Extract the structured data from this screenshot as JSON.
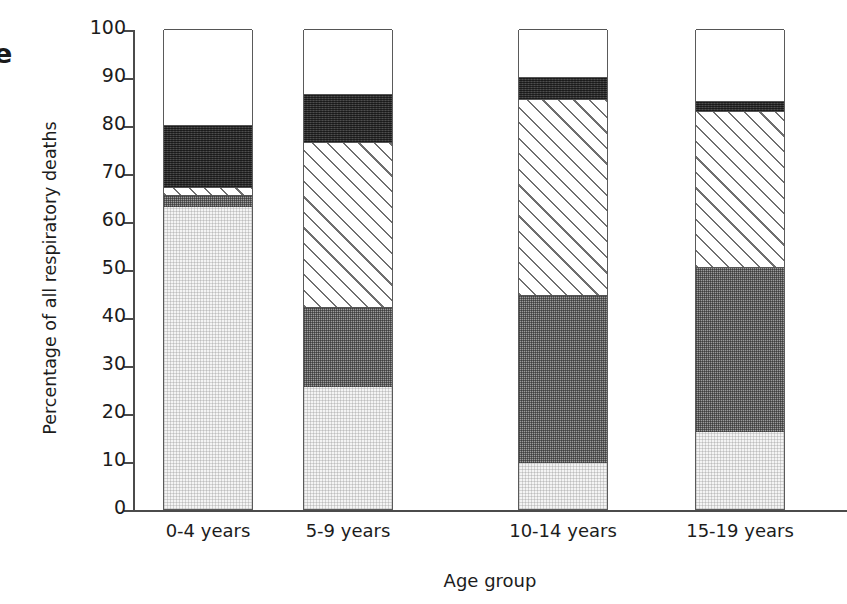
{
  "figure_letter": "e",
  "chart_data": {
    "type": "bar",
    "subtype": "stacked-bar",
    "title": "",
    "xlabel": "Age group",
    "ylabel": "Percentage of all respiratory deaths",
    "ylim": [
      0,
      100
    ],
    "yticks": [
      0,
      10,
      20,
      30,
      40,
      50,
      60,
      70,
      80,
      90,
      100
    ],
    "ytick_labels": [
      "0",
      "10",
      "20",
      "30",
      "40",
      "50",
      "60",
      "70",
      "80",
      "90",
      "100"
    ],
    "grid": false,
    "legend": "none",
    "stack_order_bottom_to_top": [
      "light-gray",
      "medium-gray",
      "diagonal-hatch",
      "dark-gray",
      "white"
    ],
    "categories": [
      "0-4 years",
      "5-9 years",
      "10-14 years",
      "15-19 years"
    ],
    "series": [
      {
        "name": "light-gray",
        "fill": "light",
        "color": "#f4f4f4",
        "values": [
          63.0,
          25.5,
          9.5,
          16.0
        ]
      },
      {
        "name": "medium-gray",
        "fill": "medium",
        "color": "#9b9b9b",
        "values": [
          2.5,
          16.5,
          35.0,
          34.5
        ]
      },
      {
        "name": "diagonal-hatch",
        "fill": "hatch",
        "color": "#ffffff",
        "values": [
          1.5,
          34.5,
          41.0,
          32.5
        ]
      },
      {
        "name": "dark-gray",
        "fill": "dark",
        "color": "#3a3a3a",
        "values": [
          13.0,
          10.0,
          4.5,
          2.0
        ]
      },
      {
        "name": "white",
        "fill": "white",
        "color": "#ffffff",
        "values": [
          20.0,
          13.5,
          10.0,
          15.0
        ]
      }
    ],
    "cumulative_tops": [
      [
        63.0,
        65.5,
        67.0,
        80.0,
        100.0
      ],
      [
        25.5,
        42.0,
        76.5,
        86.5,
        100.0
      ],
      [
        9.5,
        44.5,
        85.5,
        90.0,
        100.0
      ],
      [
        16.0,
        50.5,
        83.0,
        85.0,
        100.0
      ]
    ]
  }
}
